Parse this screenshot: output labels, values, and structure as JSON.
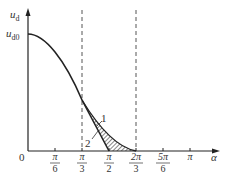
{
  "axes": {
    "y_label": "u",
    "y_label_sub": "d",
    "y_value_label": "u",
    "y_value_label_sub": "d0",
    "x_label": "α",
    "origin_label": "0"
  },
  "ticks": [
    {
      "num": "π",
      "den": "6"
    },
    {
      "num": "π",
      "den": "3"
    },
    {
      "num": "π",
      "den": "2"
    },
    {
      "num": "2π",
      "den": "3"
    },
    {
      "num": "5π",
      "den": "6"
    },
    {
      "num": "π",
      "den": ""
    }
  ],
  "curves": {
    "curve1_label": "1",
    "curve2_label": "2"
  },
  "colors": {
    "line": "#222222",
    "dash": "#555555",
    "text": "#333333"
  }
}
